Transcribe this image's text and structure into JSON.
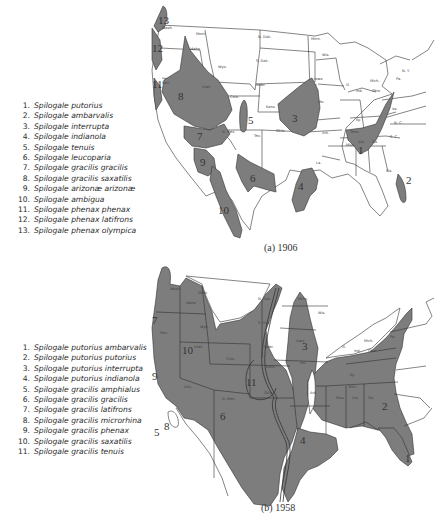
{
  "map_a": {
    "caption": "(a) 1906",
    "legend": [
      {
        "num": "1.",
        "name": "Spilogale putorius"
      },
      {
        "num": "2.",
        "name": "Spilogale ambarvalis"
      },
      {
        "num": "3.",
        "name": "Spilogale interrupta"
      },
      {
        "num": "4.",
        "name": "Spilogale indianola"
      },
      {
        "num": "5.",
        "name": "Spilogale tenuis"
      },
      {
        "num": "6.",
        "name": "Spilogale leucoparia"
      },
      {
        "num": "7.",
        "name": "Spilogale gracilis gracilis"
      },
      {
        "num": "8.",
        "name": "Spilogale gracilis saxatilis"
      },
      {
        "num": "9.",
        "name": "Spilogale arizonæ arizonæ"
      },
      {
        "num": "10.",
        "name": "Spilogale ambigua"
      },
      {
        "num": "11.",
        "name": "Spilogale phenax phenax"
      },
      {
        "num": "12.",
        "name": "Spilogale phenax latifrons"
      },
      {
        "num": "13.",
        "name": "Spilogale phenax olympica"
      }
    ],
    "region_labels": [
      "1",
      "2",
      "3",
      "4",
      "5",
      "6",
      "7",
      "8",
      "9",
      "10",
      "11",
      "12",
      "13"
    ],
    "state_labels": {
      "wash": "Wash.",
      "mont": "Mont.",
      "ndak": "N. Dak.",
      "sdak": "S. Dak.",
      "minn": "Minn.",
      "idaho": "Idaho",
      "wyo": "Wyo.",
      "nebr": "Nebr.",
      "utah": "Utah",
      "colo": "Colo.",
      "kans": "Kans.",
      "nmex": "N. Mex.",
      "tex": "Tex.",
      "okla": "Okla.",
      "iowa": "Iowa",
      "wis": "Wis.",
      "mich": "Mich.",
      "ill": "Ill.",
      "ind": "Ind.",
      "ohio": "Ohio",
      "mo": "Mo.",
      "ky": "Ky.",
      "tenn": "Tenn.",
      "ark": "Ark.",
      "la": "La.",
      "miss": "Miss.",
      "ala": "Ala.",
      "ga": "Ga.",
      "fla": "Fla.",
      "pa": "Pa.",
      "ny": "N. Y.",
      "sc": "S. C.",
      "nc": "N. C.",
      "va": "Va.",
      "nev": "Nev."
    }
  },
  "map_b": {
    "caption": "(b) 1958",
    "legend": [
      {
        "num": "1.",
        "name": "Spilogale putorius ambarvalis"
      },
      {
        "num": "2.",
        "name": "Spilogale putorius putorius"
      },
      {
        "num": "3.",
        "name": "Spilogale putorius interrupta"
      },
      {
        "num": "4.",
        "name": "Spilogale putorius indianola"
      },
      {
        "num": "5.",
        "name": "Spilogale gracilis amphialus"
      },
      {
        "num": "6.",
        "name": "Spilogale gracilis gracilis"
      },
      {
        "num": "7.",
        "name": "Spilogale gracilis latifrons"
      },
      {
        "num": "8.",
        "name": "Spilogale gracilis microrhina"
      },
      {
        "num": "9.",
        "name": "Spilogale gracilis phenax"
      },
      {
        "num": "10.",
        "name": "Spilogale gracilis saxatilis"
      },
      {
        "num": "11.",
        "name": "Spilogale gracilis tenuis"
      }
    ],
    "region_labels": [
      "1",
      "2",
      "3",
      "4",
      "5",
      "6",
      "7",
      "8",
      "9",
      "10",
      "11"
    ],
    "state_labels": {
      "wash": "Wash.",
      "mont": "Mont.",
      "ndak": "N. Dak.",
      "wyo": "Wyo.",
      "sdak": "S. Dak.",
      "idaho": "Idaho",
      "utah": "Utah",
      "nebr": "Nebr.",
      "colo": "Colo.",
      "kans": "Kans.",
      "minn": "Minn.",
      "iowa": "Iowa",
      "mo": "Mo.",
      "wis": "Wis.",
      "mich": "Mich.",
      "ill": "Ill.",
      "ind": "Ind.",
      "ohio": "Ohio",
      "okla": "Okla.",
      "ark": "Ark.",
      "tenn": "Tenn.",
      "miss": "Miss.",
      "ala": "Ala.",
      "ga": "Ga.",
      "nmex": "N. Mex.",
      "ariz": "Ariz.",
      "pa": "Pa.",
      "ky": "Ky.",
      "nev": "Nev."
    }
  },
  "colors": {
    "range_fill": "#7d7d7d",
    "border": "#333333",
    "land": "#ffffff",
    "text": "#2a2a2a"
  }
}
